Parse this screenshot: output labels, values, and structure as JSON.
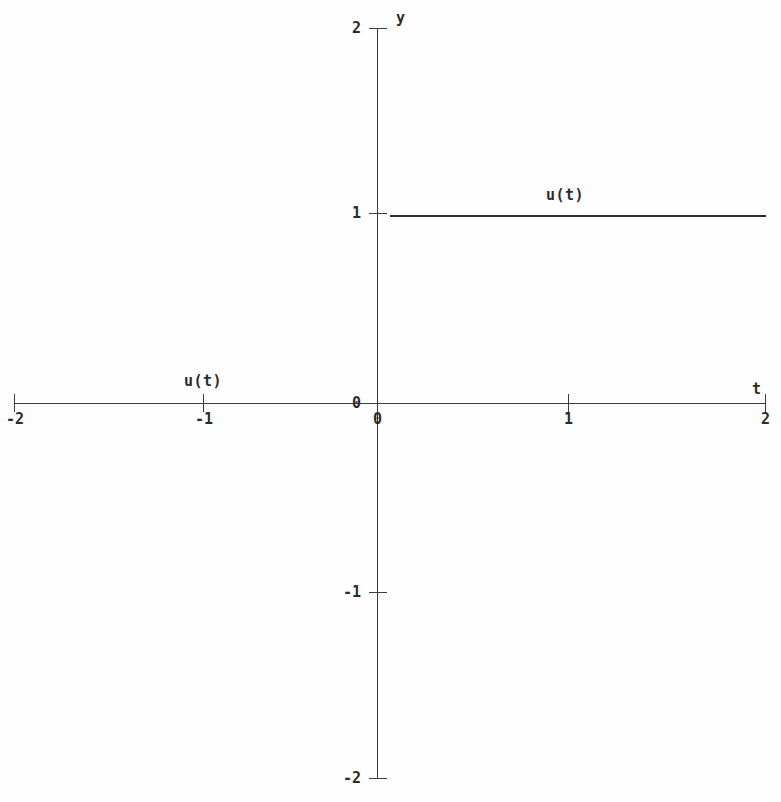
{
  "figure": {
    "background_color": "#fefefe",
    "line_color": "#2e2e2e",
    "axis_color": "#3c3c3c",
    "width": 781,
    "height": 802
  },
  "chart_data": {
    "type": "line",
    "title": "",
    "subtitle": "",
    "xlabel": "t",
    "ylabel": "y",
    "xlim": [
      -2,
      2
    ],
    "ylim": [
      -2,
      2
    ],
    "grid": false,
    "legend_position": "none",
    "x_ticks": [
      -2,
      -1,
      0,
      1,
      2
    ],
    "x_tick_labels": [
      "-2",
      "-1",
      "0",
      "1",
      "2"
    ],
    "y_ticks": [
      2,
      1,
      0,
      -1,
      -2
    ],
    "y_tick_labels": [
      "2",
      "1",
      "0",
      "-1",
      "-2"
    ],
    "series": [
      {
        "name": "u(t)",
        "description": "unit step function",
        "x": [
          -2,
          0,
          0,
          2
        ],
        "values": [
          0,
          0,
          1,
          1
        ],
        "segments": [
          {
            "name": "zero-branch",
            "x_start": -2,
            "x_end": 0,
            "y": 0
          },
          {
            "name": "unit-branch",
            "x_start": 0,
            "x_end": 2,
            "y": 1
          }
        ]
      }
    ],
    "annotations": [
      {
        "text": "u(t)",
        "x": 1.15,
        "y": 1.17,
        "name": "annotation-ut-upper"
      },
      {
        "text": "u(t)",
        "x": -0.93,
        "y": 0.16,
        "name": "annotation-ut-lower"
      }
    ]
  },
  "labels": {
    "y_axis_name": "y",
    "x_axis_name": "t",
    "y_top": "2",
    "y_one": "1",
    "y_zero": "0",
    "y_neg_one": "-1",
    "y_neg_two": "-2",
    "x_neg_two": "-2",
    "x_neg_one": "-1",
    "x_zero": "0",
    "x_one": "1",
    "x_two": "2",
    "series_upper": "u(t)",
    "series_lower": "u(t)"
  }
}
